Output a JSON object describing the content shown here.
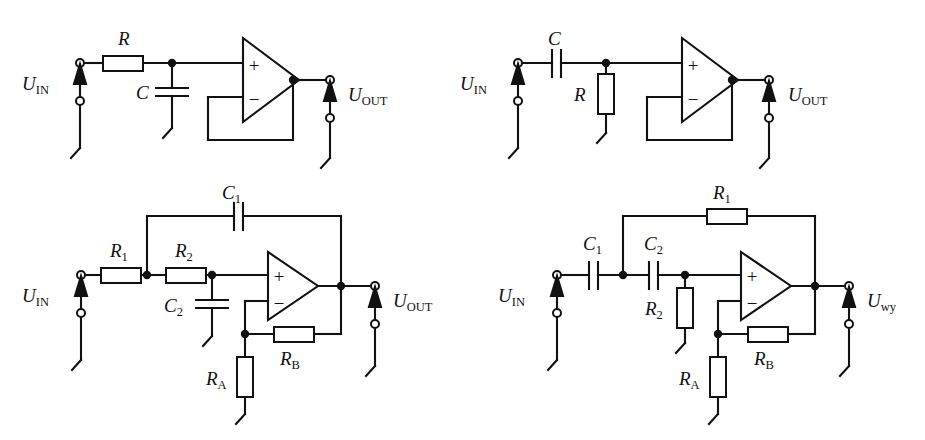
{
  "figure": {
    "type": "circuit-schematic-set",
    "background": "#ffffff",
    "ink": "#111111",
    "panel_count": 4
  },
  "circuits": [
    {
      "id": "top-left",
      "name": "first-order-active-low-pass-filter",
      "input_label": "U",
      "input_sub": "IN",
      "output_label": "U",
      "output_sub": "OUT",
      "components": [
        {
          "ref": "R",
          "sub": "",
          "type": "resistor",
          "orientation": "horizontal",
          "role": "series-input"
        },
        {
          "ref": "C",
          "sub": "",
          "type": "capacitor",
          "orientation": "vertical",
          "role": "shunt-to-ground"
        }
      ],
      "opamp": {
        "plus": "+",
        "minus": "−",
        "feedback": "unity-gain-follower"
      }
    },
    {
      "id": "top-right",
      "name": "first-order-active-high-pass-filter",
      "input_label": "U",
      "input_sub": "IN",
      "output_label": "U",
      "output_sub": "OUT",
      "components": [
        {
          "ref": "C",
          "sub": "",
          "type": "capacitor",
          "orientation": "horizontal",
          "role": "series-input"
        },
        {
          "ref": "R",
          "sub": "",
          "type": "resistor",
          "orientation": "vertical",
          "role": "shunt-to-ground"
        }
      ],
      "opamp": {
        "plus": "+",
        "minus": "−",
        "feedback": "unity-gain-follower"
      }
    },
    {
      "id": "bottom-left",
      "name": "sallen-key-second-order-low-pass-filter",
      "input_label": "U",
      "input_sub": "IN",
      "output_label": "U",
      "output_sub": "OUT",
      "components": [
        {
          "ref": "R",
          "sub": "1",
          "type": "resistor",
          "orientation": "horizontal",
          "role": "series-input"
        },
        {
          "ref": "R",
          "sub": "2",
          "type": "resistor",
          "orientation": "horizontal",
          "role": "series-second"
        },
        {
          "ref": "C",
          "sub": "1",
          "type": "capacitor",
          "orientation": "horizontal",
          "role": "feedback-top"
        },
        {
          "ref": "C",
          "sub": "2",
          "type": "capacitor",
          "orientation": "vertical",
          "role": "shunt-to-ground"
        },
        {
          "ref": "R",
          "sub": "A",
          "type": "resistor",
          "orientation": "vertical",
          "role": "gain-to-ground"
        },
        {
          "ref": "R",
          "sub": "B",
          "type": "resistor",
          "orientation": "horizontal",
          "role": "gain-feedback"
        }
      ],
      "opamp": {
        "plus": "+",
        "minus": "−",
        "feedback": "non-inverting-gain"
      }
    },
    {
      "id": "bottom-right",
      "name": "sallen-key-second-order-high-pass-filter",
      "input_label": "U",
      "input_sub": "IN",
      "output_label": "U",
      "output_sub": "wy",
      "components": [
        {
          "ref": "C",
          "sub": "1",
          "type": "capacitor",
          "orientation": "horizontal",
          "role": "series-input"
        },
        {
          "ref": "C",
          "sub": "2",
          "type": "capacitor",
          "orientation": "horizontal",
          "role": "series-second"
        },
        {
          "ref": "R",
          "sub": "1",
          "type": "resistor",
          "orientation": "horizontal",
          "role": "feedback-top"
        },
        {
          "ref": "R",
          "sub": "2",
          "type": "resistor",
          "orientation": "vertical",
          "role": "shunt-to-ground"
        },
        {
          "ref": "R",
          "sub": "A",
          "type": "resistor",
          "orientation": "vertical",
          "role": "gain-to-ground"
        },
        {
          "ref": "R",
          "sub": "B",
          "type": "resistor",
          "orientation": "horizontal",
          "role": "gain-feedback"
        }
      ],
      "opamp": {
        "plus": "+",
        "minus": "−",
        "feedback": "non-inverting-gain"
      }
    }
  ]
}
